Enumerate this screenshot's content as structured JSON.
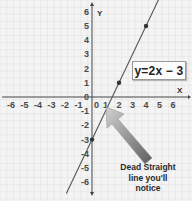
{
  "chart_data": {
    "type": "line",
    "title": "",
    "xlabel": "X",
    "ylabel": "Y",
    "xlim": [
      -6,
      6
    ],
    "ylim": [
      -6,
      6
    ],
    "grid": true,
    "x_ticks": [
      "-6",
      "-5",
      "-4",
      "-3",
      "-2",
      "-1",
      "0",
      "1",
      "2",
      "3",
      "4",
      "5",
      "6"
    ],
    "y_ticks": [
      "6",
      "5",
      "4",
      "3",
      "2",
      "1",
      "0",
      "-1",
      "-2",
      "-3",
      "-4",
      "-5",
      "-6"
    ],
    "series": [
      {
        "name": "y=2x - 3",
        "equation": "y = 2x - 3",
        "marked_points": [
          {
            "x": 0,
            "y": -3
          },
          {
            "x": 2,
            "y": 1
          },
          {
            "x": 4,
            "y": 5
          }
        ],
        "color": "#555555"
      }
    ],
    "annotations": [
      {
        "text": "y=2x − 3",
        "type": "equation-label"
      },
      {
        "text": "Dead Straight line you'll notice",
        "type": "arrow-callout"
      }
    ]
  },
  "labels": {
    "equation": "y=2x − 3",
    "caption_line1": "Dead Straight",
    "caption_line2": "line you'll",
    "caption_line3": "notice",
    "x_axis": "X",
    "y_axis": "Y"
  },
  "colors": {
    "background": "#f4f4f4",
    "grid": "#dedede",
    "axis": "#444444",
    "line": "#555555",
    "arrow_dark": "#6a6a6a",
    "arrow_light": "#c8c8c8"
  }
}
